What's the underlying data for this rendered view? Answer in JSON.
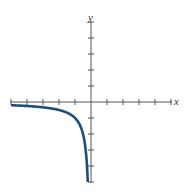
{
  "chart_data": {
    "type": "line",
    "title": "",
    "xlabel": "x",
    "ylabel": "y",
    "xlim": [
      -5,
      5
    ],
    "ylim": [
      -5,
      5
    ],
    "grid": false,
    "legend": null,
    "x_ticks": [
      -5,
      -4,
      -3,
      -2,
      -1,
      1,
      2,
      3,
      4,
      5
    ],
    "y_ticks": [
      -5,
      -4,
      -3,
      -2,
      -1,
      1,
      2,
      3,
      4,
      5
    ],
    "series": [
      {
        "name": "y = 1/x (x < 0)",
        "color": "#1f4e79",
        "x": [
          -5,
          -4.5,
          -4,
          -3.5,
          -3,
          -2.5,
          -2,
          -1.5,
          -1.25,
          -1,
          -0.8,
          -0.6,
          -0.5,
          -0.4,
          -0.3,
          -0.25,
          -0.2
        ],
        "y": [
          -0.2,
          -0.222,
          -0.25,
          -0.286,
          -0.333,
          -0.4,
          -0.5,
          -0.667,
          -0.8,
          -1,
          -1.25,
          -1.667,
          -2,
          -2.5,
          -3.333,
          -4,
          -5
        ]
      }
    ]
  },
  "axes": {
    "x_label": "x",
    "y_label": "y",
    "axis_color": "#555555",
    "curve_color": "#1f4e79"
  }
}
